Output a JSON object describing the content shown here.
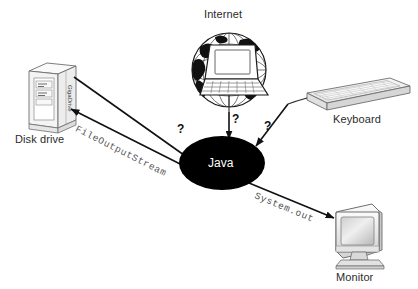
{
  "diagram": {
    "title_visible": false,
    "background_color": "#ffffff",
    "center_node": {
      "label": "Java",
      "shape": "ellipse",
      "fill_color": "#000000",
      "text_color": "#ffffff"
    },
    "nodes": [
      {
        "id": "internet",
        "label": "Internet",
        "icon": "globe-laptop-icon",
        "position": "top-center"
      },
      {
        "id": "disk-drive",
        "label": "Disk drive",
        "icon": "tower-disk-drive-icon",
        "badge": "GigaDrive",
        "position": "left"
      },
      {
        "id": "keyboard",
        "label": "Keyboard",
        "icon": "keyboard-icon",
        "position": "right-top"
      },
      {
        "id": "monitor",
        "label": "Monitor",
        "icon": "crt-monitor-icon",
        "position": "right-bottom"
      }
    ],
    "edges": [
      {
        "id": "internet-to-java",
        "from": "internet",
        "to": "center_node",
        "label": "?",
        "direction": "in"
      },
      {
        "id": "disk-to-java",
        "from": "disk-drive",
        "to": "center_node",
        "label": "?",
        "direction": "in"
      },
      {
        "id": "keyboard-to-java",
        "from": "keyboard",
        "to": "center_node",
        "label": "?",
        "direction": "in"
      },
      {
        "id": "java-to-disk",
        "from": "center_node",
        "to": "disk-drive",
        "label": "FileOutputStream",
        "direction": "out"
      },
      {
        "id": "java-to-monitor",
        "from": "center_node",
        "to": "monitor",
        "label": "System.out",
        "direction": "out"
      }
    ],
    "colors": {
      "ink": "#1a1a1a",
      "stream_text": "#555555",
      "label_text": "#2b2b2b",
      "device_outline": "#6e6e6e",
      "device_fill": "#f2f2f2"
    }
  }
}
